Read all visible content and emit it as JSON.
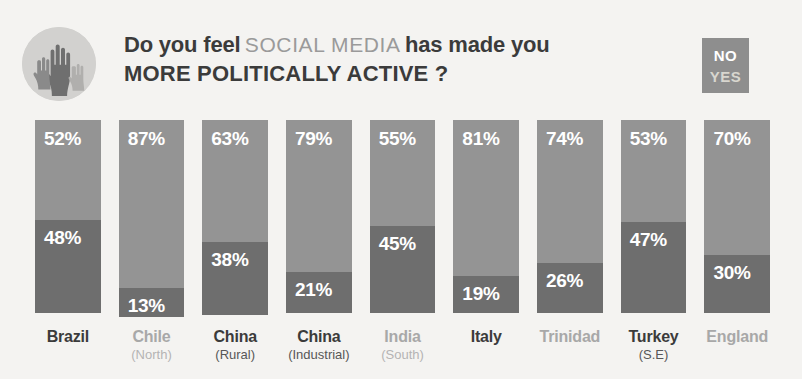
{
  "header": {
    "hands_icon": "raised-hands-icon",
    "headline_line1_bold_a": "Do you feel",
    "headline_line1_light": "SOCIAL MEDIA",
    "headline_line1_bold_b": "has made you",
    "headline_line2": "MORE POLITICALLY ACTIVE ?",
    "legend": {
      "no_label": "NO",
      "yes_label": "YES",
      "box_color": "#8e8e8e"
    }
  },
  "colors": {
    "background": "#f4f3f1",
    "no_segment": "#949494",
    "yes_segment": "#6e6e6e",
    "text_dark": "#3b3b3b",
    "text_light": "#a8a8a8",
    "value_text": "#ffffff"
  },
  "chart_data": {
    "type": "bar",
    "title": "Do you feel SOCIAL MEDIA has made you MORE POLITICALLY ACTIVE ?",
    "xlabel": "",
    "ylabel": "",
    "ylim": [
      0,
      100
    ],
    "grid": false,
    "stacked": true,
    "legend_position": "top-right",
    "categories": [
      "Brazil",
      "Chile",
      "China",
      "China",
      "India",
      "Italy",
      "Trinidad",
      "Turkey",
      "England"
    ],
    "category_sublabels": [
      "",
      "(North)",
      "(Rural)",
      "(Industrial)",
      "(South)",
      "",
      "",
      "(S.E)",
      ""
    ],
    "category_tone": [
      "dark",
      "light",
      "dark",
      "dark",
      "light",
      "dark",
      "light",
      "dark",
      "light"
    ],
    "series": [
      {
        "name": "NO",
        "color": "#949494",
        "values": [
          52,
          87,
          63,
          79,
          55,
          81,
          74,
          53,
          70
        ]
      },
      {
        "name": "YES",
        "color": "#6e6e6e",
        "values": [
          48,
          13,
          38,
          21,
          45,
          19,
          26,
          47,
          30
        ]
      }
    ],
    "value_labels": [
      {
        "no": "52%",
        "yes": "48%"
      },
      {
        "no": "87%",
        "yes": "13%"
      },
      {
        "no": "63%",
        "yes": "38%"
      },
      {
        "no": "79%",
        "yes": "21%"
      },
      {
        "no": "55%",
        "yes": "45%"
      },
      {
        "no": "81%",
        "yes": "19%"
      },
      {
        "no": "74%",
        "yes": "26%"
      },
      {
        "no": "53%",
        "yes": "47%"
      },
      {
        "no": "70%",
        "yes": "30%"
      }
    ]
  }
}
